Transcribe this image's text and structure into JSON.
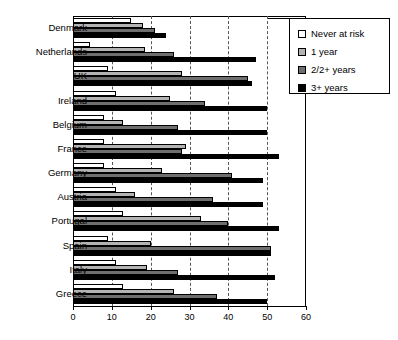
{
  "chart": {
    "type": "bar",
    "title": "",
    "xlabel": "",
    "ylabel": ""
  },
  "legend": {
    "position": "top-right",
    "items": [
      {
        "label": "Never at risk",
        "color": "#ffffff",
        "swatch_name": "legend-swatch-never-at-risk"
      },
      {
        "label": "1 year",
        "color": "#b3b3b3",
        "swatch_name": "legend-swatch-1-year"
      },
      {
        "label": "2/2+ years",
        "color": "#6e6e6e",
        "swatch_name": "legend-swatch-2plus-years"
      },
      {
        "label": "3+ years",
        "color": "#000000",
        "swatch_name": "legend-swatch-3plus-years"
      }
    ]
  },
  "axis": {
    "x_ticks": [
      "0",
      "10",
      "20",
      "30",
      "40",
      "50",
      "60"
    ],
    "x_min": 0,
    "x_max": 60,
    "grid": "vertical-dashed"
  },
  "categories": [
    "Denmark",
    "Netherlands",
    "UK",
    "Ireland",
    "Belgium",
    "France",
    "Germany",
    "Austria",
    "Portugal",
    "Spain",
    "Italy",
    "Greece"
  ],
  "chart_data": {
    "type": "bar",
    "orientation": "horizontal",
    "title": "",
    "xlabel": "",
    "ylabel": "",
    "xlim": [
      0,
      60
    ],
    "grid": true,
    "legend_position": "top-right",
    "categories": [
      "Denmark",
      "Netherlands",
      "UK",
      "Ireland",
      "Belgium",
      "France",
      "Germany",
      "Austria",
      "Portugal",
      "Spain",
      "Italy",
      "Greece"
    ],
    "tick_labels": [
      "0",
      "10",
      "20",
      "30",
      "40",
      "50",
      "60"
    ],
    "series": [
      {
        "name": "Never at risk",
        "color": "#ffffff",
        "values": [
          15,
          4.5,
          9,
          11,
          8,
          8,
          8,
          11,
          13,
          9,
          11,
          13
        ]
      },
      {
        "name": "1 year",
        "color": "#b3b3b3",
        "values": [
          18,
          18.5,
          28,
          25,
          13,
          29,
          23,
          16,
          33,
          20,
          19,
          26
        ]
      },
      {
        "name": "2/2+ years",
        "color": "#6e6e6e",
        "values": [
          21,
          26,
          45,
          34,
          27,
          28,
          41,
          36,
          40,
          51,
          27,
          37
        ]
      },
      {
        "name": "3+ years",
        "color": "#000000",
        "values": [
          24,
          47,
          46,
          50,
          50,
          53,
          49,
          49,
          53,
          51,
          52,
          50
        ]
      }
    ]
  }
}
